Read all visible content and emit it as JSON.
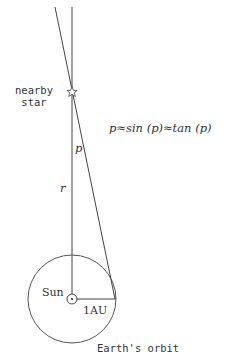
{
  "diagram": {
    "colors": {
      "background": "#ffffff",
      "stroke": "#444444",
      "text": "#333333"
    },
    "labels": {
      "star": [
        "nearby",
        "star"
      ],
      "formula": "p≈sin (p)≈tan (p)",
      "parallax_angle": "p",
      "distance": "r",
      "sun": "Sun",
      "baseline": "1AU",
      "orbit": "Earth's orbit"
    },
    "geometry": {
      "sun_center": [
        72,
        299
      ],
      "orbit_radius": 44,
      "star_position": [
        72,
        92
      ],
      "vertical_line": {
        "from": [
          72,
          7
        ],
        "to": [
          72,
          299
        ]
      },
      "sightline": {
        "from": [
          55,
          7
        ],
        "to": [
          116,
          299
        ]
      },
      "baseline": {
        "from": [
          72,
          299
        ],
        "to": [
          116,
          299
        ]
      }
    }
  }
}
